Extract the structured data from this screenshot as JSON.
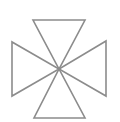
{
  "figure": {
    "stroke_color": "#8c8c8c",
    "stroke_width": 1.6,
    "background": "#ffffff",
    "center": [
      59,
      69
    ],
    "triangles": [
      {
        "name": "top",
        "points": [
          [
            33,
            20
          ],
          [
            85,
            20
          ],
          [
            59,
            69
          ]
        ]
      },
      {
        "name": "bottom",
        "points": [
          [
            34,
            118
          ],
          [
            85,
            118
          ],
          [
            59,
            69
          ]
        ]
      },
      {
        "name": "left",
        "points": [
          [
            12,
            42
          ],
          [
            12,
            96
          ],
          [
            59,
            69
          ]
        ]
      },
      {
        "name": "right",
        "points": [
          [
            106,
            41
          ],
          [
            106,
            96
          ],
          [
            59,
            69
          ]
        ]
      }
    ]
  }
}
